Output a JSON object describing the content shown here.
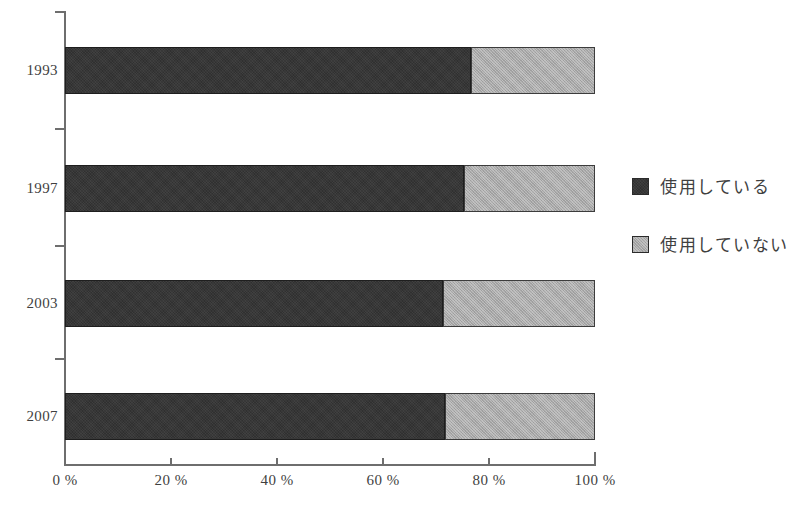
{
  "chart_data": {
    "type": "bar",
    "orientation": "horizontal",
    "stacked": true,
    "normalized_percent": true,
    "title": "",
    "subtitle": "",
    "xlabel": "",
    "ylabel": "",
    "categories": [
      "1993",
      "1997",
      "2003",
      "2007"
    ],
    "series": [
      {
        "name": "使用している",
        "color": "#303030",
        "values": [
          76.6,
          75.3,
          71.3,
          71.7
        ]
      },
      {
        "name": "使用していない",
        "color": "#a8a8a8",
        "values": [
          23.4,
          24.7,
          28.7,
          28.3
        ]
      }
    ],
    "xlim": [
      0,
      100
    ],
    "xticks": [
      0,
      20,
      40,
      60,
      80,
      100
    ],
    "xtick_labels": [
      "0 %",
      "20 %",
      "40 %",
      "60 %",
      "80 %",
      "100 %"
    ],
    "grid": false,
    "legend_position": "right",
    "legend_entries": [
      "使用している",
      "使用していない"
    ]
  },
  "axis": {
    "x_tick_labels": [
      "0 %",
      "20 %",
      "40 %",
      "60 %",
      "80 %",
      "100 %"
    ],
    "y_tick_labels": [
      "1993",
      "1997",
      "2003",
      "2007"
    ]
  },
  "legend": {
    "items": [
      {
        "label": "使用している",
        "swatch": "#303030"
      },
      {
        "label": "使用していない",
        "swatch": "#a8a8a8"
      }
    ]
  }
}
